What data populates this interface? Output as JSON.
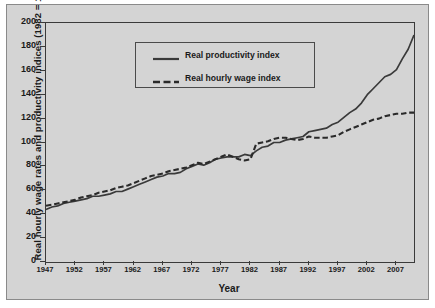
{
  "chart_data": {
    "type": "line",
    "title": "",
    "xlabel": "Year",
    "ylabel": "Real hourly wage rates and productivity indices (1982 = 100)",
    "xlim": [
      1947,
      2010
    ],
    "ylim": [
      0,
      200
    ],
    "grid": false,
    "legend_position": "top-center",
    "xticks": [
      1947,
      1952,
      1957,
      1962,
      1967,
      1972,
      1977,
      1982,
      1987,
      1992,
      1997,
      2002,
      2007
    ],
    "yticks": [
      0,
      20,
      40,
      60,
      80,
      100,
      120,
      140,
      160,
      180,
      200
    ],
    "x": [
      1947,
      1948,
      1949,
      1950,
      1951,
      1952,
      1953,
      1954,
      1955,
      1956,
      1957,
      1958,
      1959,
      1960,
      1961,
      1962,
      1963,
      1964,
      1965,
      1966,
      1967,
      1968,
      1969,
      1970,
      1971,
      1972,
      1973,
      1974,
      1975,
      1976,
      1977,
      1978,
      1979,
      1980,
      1981,
      1982,
      1983,
      1984,
      1985,
      1986,
      1987,
      1988,
      1989,
      1990,
      1991,
      1992,
      1993,
      1994,
      1995,
      1996,
      1997,
      1998,
      1999,
      2000,
      2001,
      2002,
      2003,
      2004,
      2005,
      2006,
      2007,
      2008,
      2009,
      2010
    ],
    "series": [
      {
        "name": "Real productivity index",
        "style": "solid",
        "color": "#3a3a3a",
        "values": [
          44,
          46,
          47,
          49,
          50,
          51,
          52,
          53,
          55,
          55,
          56,
          57,
          59,
          59,
          61,
          63,
          65,
          67,
          69,
          71,
          72,
          74,
          74,
          75,
          78,
          80,
          82,
          81,
          83,
          86,
          87,
          88,
          88,
          88,
          90,
          89,
          93,
          96,
          97,
          100,
          100,
          102,
          103,
          104,
          105,
          109,
          110,
          111,
          112,
          115,
          117,
          121,
          125,
          128,
          133,
          140,
          145,
          150,
          155,
          157,
          161,
          170,
          178,
          190
        ]
      },
      {
        "name": "Real hourly wage index",
        "style": "dashed",
        "color": "#2a2a2a",
        "values": [
          47,
          48,
          49,
          50,
          51,
          52,
          54,
          55,
          56,
          58,
          59,
          60,
          62,
          63,
          64,
          66,
          68,
          70,
          72,
          73,
          74,
          76,
          77,
          78,
          79,
          81,
          83,
          82,
          84,
          86,
          88,
          90,
          88,
          86,
          85,
          86,
          99,
          100,
          101,
          103,
          104,
          104,
          103,
          102,
          103,
          105,
          104,
          104,
          104,
          105,
          106,
          109,
          111,
          113,
          115,
          117,
          119,
          120,
          122,
          123,
          124,
          124,
          125,
          125
        ]
      }
    ]
  },
  "legend": {
    "items": [
      {
        "label": "Real productivity index",
        "style": "solid"
      },
      {
        "label": "Real hourly wage index",
        "style": "dashed"
      }
    ]
  },
  "axes": {
    "x_title": "Year",
    "y_title": "Real hourly wage rates and productivity indices (1982 = 100)",
    "x_tick_labels": [
      "1947",
      "1952",
      "1957",
      "1962",
      "1967",
      "1972",
      "1977",
      "1982",
      "1987",
      "1992",
      "1997",
      "2002",
      "2007"
    ],
    "y_tick_labels": [
      "200",
      "180",
      "160",
      "140",
      "120",
      "100",
      "80",
      "60",
      "40",
      "20",
      "0"
    ]
  },
  "colors": {
    "panel_background": "#d4d4d4",
    "axis": "#3a3a3a",
    "text": "#1a1a1a",
    "productivity_line": "#3a3a3a",
    "wage_line": "#2a2a2a"
  }
}
